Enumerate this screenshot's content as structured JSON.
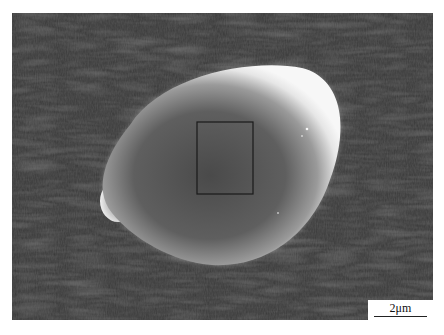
{
  "figure": {
    "type": "SEM micrograph",
    "scale_bar": {
      "label": "2μm"
    },
    "annotation": {
      "shape": "rectangle",
      "description": "selected analysis region at particle center"
    },
    "colors": {
      "background": "#3c3c3c",
      "particle_edge": "#f2f2f2",
      "particle_center": "#4a4a4a",
      "box_stroke": "#1a1a1a"
    }
  }
}
